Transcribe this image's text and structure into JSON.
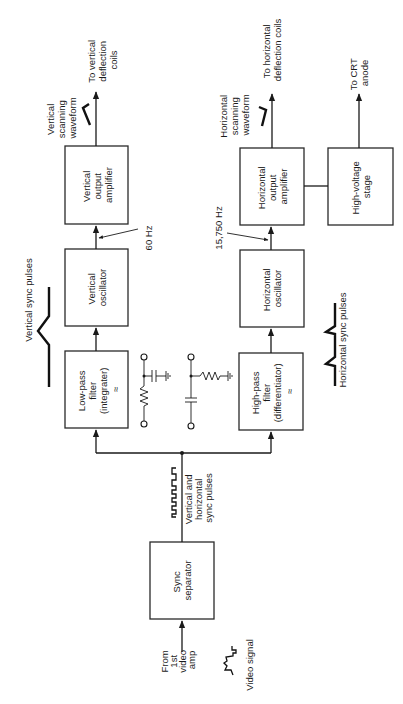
{
  "diagram": {
    "blocks": {
      "vertical_output_amp": [
        "Vertical",
        "output",
        "amplifier"
      ],
      "horizontal_output_amp": [
        "Horizontal",
        "output",
        "amplifier"
      ],
      "high_voltage_stage": [
        "High-voltage",
        "stage"
      ],
      "vertical_oscillator": [
        "Vertical",
        "oscillator"
      ],
      "horizontal_oscillator": [
        "Horizontal",
        "oscillator"
      ],
      "low_pass_filter": [
        "Low-pass",
        "filter",
        "(integrater)"
      ],
      "high_pass_filter": [
        "High-pass",
        "filter",
        "(differentiator)"
      ],
      "sync_separator": [
        "Sync",
        "separator"
      ]
    },
    "filter_symbol": "≈",
    "labels": {
      "to_vertical_coils": [
        "To vertical",
        "deflection",
        "coils"
      ],
      "to_horizontal_coils": [
        "To horizontal",
        "deflection coils"
      ],
      "to_crt_anode": [
        "To CRT",
        "anode"
      ],
      "vertical_scanning_waveform": [
        "Vertical",
        "scanning",
        "waveform"
      ],
      "horizontal_scanning_waveform": [
        "Horizontal",
        "scanning",
        "waveform"
      ],
      "vertical_freq": "60 Hz",
      "horizontal_freq": "15,750 Hz",
      "vertical_sync_pulses": "Vertical sync pulses",
      "horizontal_sync_pulses": "Horizontal sync pulses",
      "combined_sync_pulses": [
        "Vertical and",
        "horizontal",
        "sync pulses"
      ],
      "from_video_amp": [
        "From",
        "1st",
        "video",
        "amp"
      ],
      "video_signal": "Video signal"
    },
    "connections": [
      {
        "from": "From 1st video amp",
        "to": "Sync separator"
      },
      {
        "from": "Sync separator",
        "to": "Low-pass filter (integrater)"
      },
      {
        "from": "Sync separator",
        "to": "High-pass filter (differentiator)"
      },
      {
        "from": "Low-pass filter (integrater)",
        "to": "Vertical oscillator"
      },
      {
        "from": "Vertical oscillator",
        "to": "Vertical output amplifier",
        "label": "60 Hz"
      },
      {
        "from": "Vertical output amplifier",
        "to": "To vertical deflection coils"
      },
      {
        "from": "High-pass filter (differentiator)",
        "to": "Horizontal oscillator"
      },
      {
        "from": "Horizontal oscillator",
        "to": "Horizontal output amplifier",
        "label": "15,750 Hz"
      },
      {
        "from": "Horizontal output amplifier",
        "to": "To horizontal deflection coils"
      },
      {
        "from": "Horizontal output amplifier",
        "to": "High-voltage stage"
      },
      {
        "from": "High-voltage stage",
        "to": "To CRT anode"
      }
    ]
  }
}
